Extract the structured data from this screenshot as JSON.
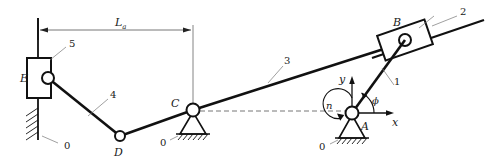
{
  "figure": {
    "type": "kinematic-linkage-diagram",
    "background_color": "#ffffff",
    "line_color": "#111111",
    "thin_line_color": "#555555",
    "width": 485,
    "height": 163
  },
  "dimension": {
    "name": "La",
    "symbol": "L",
    "subscript": "a",
    "from_x": 38,
    "to_x": 193,
    "y": 30
  },
  "joints": [
    {
      "name": "E",
      "label": "E",
      "label_x": 22,
      "label_y": 82,
      "x": 48,
      "y": 78,
      "kind": "slider-pin"
    },
    {
      "name": "D",
      "label": "D",
      "label_x": 116,
      "label_y": 154,
      "x": 120,
      "y": 136,
      "kind": "pin"
    },
    {
      "name": "C",
      "label": "C",
      "label_x": 174,
      "label_y": 105,
      "x": 193,
      "y": 110,
      "kind": "fixed-pivot"
    },
    {
      "name": "A",
      "label": "A",
      "label_x": 363,
      "label_y": 128,
      "x": 352,
      "y": 113,
      "kind": "fixed-pivot"
    },
    {
      "name": "B",
      "label": "B",
      "label_x": 396,
      "label_y": 25,
      "x": 405,
      "y": 40,
      "kind": "slider-pin"
    }
  ],
  "links": [
    {
      "number": "1",
      "label_x": 396,
      "label_y": 82,
      "desc": "crank-A-to-B"
    },
    {
      "number": "2",
      "label_x": 463,
      "label_y": 12,
      "desc": "inclined-slide-rail"
    },
    {
      "number": "3",
      "label_x": 286,
      "label_y": 62,
      "desc": "rocker-C-to-B-side"
    },
    {
      "number": "4",
      "label_x": 112,
      "label_y": 101,
      "desc": "coupler-E-to-D"
    },
    {
      "number": "5",
      "label_x": 72,
      "label_y": 44,
      "desc": "slider-block-E"
    }
  ],
  "grounds": [
    {
      "number": "0",
      "label_x": 64,
      "label_y": 146,
      "desc": "ground-vertical-rail-E"
    },
    {
      "number": "0",
      "label_x": 163,
      "label_y": 143,
      "desc": "ground-pivot-C"
    },
    {
      "number": "0",
      "label_x": 322,
      "label_y": 147,
      "desc": "ground-pivot-A"
    }
  ],
  "axes": {
    "x_label": "x",
    "x_label_x": 394,
    "x_label_y": 126,
    "y_label": "y",
    "y_label_x": 341,
    "y_label_y": 80,
    "origin_x": 352,
    "origin_y": 113
  },
  "angle": {
    "symbol": "ϕ",
    "label_x": 375,
    "label_y": 105,
    "desc": "crank-angle-phi-from-x-axis"
  },
  "rotation": {
    "symbol": "n",
    "label_x": 330,
    "label_y": 108,
    "desc": "input-rotation-speed-n"
  }
}
